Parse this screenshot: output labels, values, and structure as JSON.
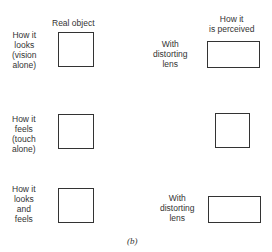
{
  "headers": {
    "real": "Real object",
    "perceived": "How it\nis perceived"
  },
  "rows": [
    {
      "left_label": "How it\nlooks\n(vision\nalone)",
      "right_label": "With\ndistorting\nlens"
    },
    {
      "left_label": "How it\nfeels\n(touch\nalone)",
      "right_label": ""
    },
    {
      "left_label": "How it\nlooks\nand\nfeels",
      "right_label": "With\ndistorting\nlens"
    }
  ],
  "caption": "(b)"
}
